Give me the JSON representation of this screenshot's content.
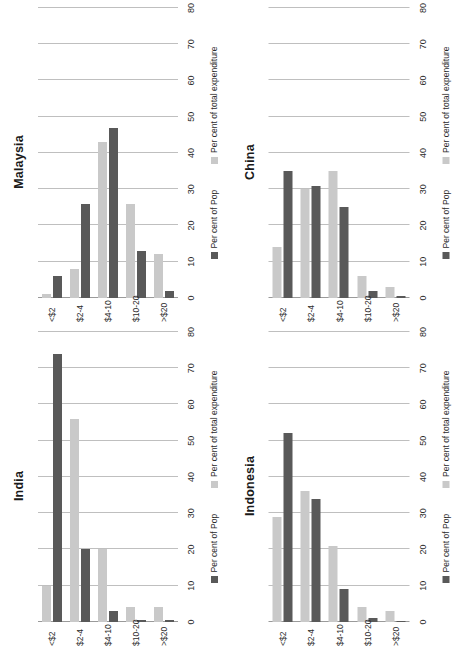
{
  "figure": {
    "layout": "2x2 grid of rotated horizontal bar charts",
    "panels_order": [
      "malaysia",
      "china",
      "india",
      "indonesia"
    ],
    "colors": {
      "pop_series": "#595959",
      "expenditure_series": "#c9c9c9",
      "gridline": "#bfbfbf",
      "background": "#ffffff"
    }
  },
  "legend": {
    "pop_label": "Per cent of Pop",
    "expenditure_label": "Per cent of total expenditure",
    "pop_swatch": "legend-swatch-pop",
    "expenditure_swatch": "legend-swatch-expenditure"
  },
  "axis": {
    "ticks": [
      "0",
      "10",
      "20",
      "30",
      "40",
      "50",
      "60",
      "70",
      "80"
    ],
    "categories": [
      "<$2",
      "$2-4",
      "$4-10",
      "$10-20",
      ">$20"
    ]
  },
  "chart_data": [
    {
      "type": "bar",
      "title": "Malaysia",
      "orientation": "horizontal",
      "categories": [
        "<$2",
        "$2-4",
        "$4-10",
        "$10-20",
        ">$20"
      ],
      "series": [
        {
          "name": "Per cent of Pop",
          "values": [
            6,
            26,
            47,
            13,
            2
          ]
        },
        {
          "name": "Per cent of total expenditure",
          "values": [
            1,
            8,
            43,
            26,
            12
          ]
        }
      ],
      "xlabel": "",
      "ylabel": "",
      "xlim": [
        0,
        80
      ],
      "ticks": [
        0,
        10,
        20,
        30,
        40,
        50,
        60,
        70,
        80
      ],
      "grid": true,
      "legend_position": "bottom"
    },
    {
      "type": "bar",
      "title": "China",
      "orientation": "horizontal",
      "categories": [
        "<$2",
        "$2-4",
        "$4-10",
        "$10-20",
        ">$20"
      ],
      "series": [
        {
          "name": "Per cent of Pop",
          "values": [
            35,
            31,
            25,
            2,
            0.5
          ]
        },
        {
          "name": "Per cent of total expenditure",
          "values": [
            14,
            30,
            35,
            6,
            3
          ]
        }
      ],
      "xlabel": "",
      "ylabel": "",
      "xlim": [
        0,
        80
      ],
      "ticks": [
        0,
        10,
        20,
        30,
        40,
        50,
        60,
        70,
        80
      ],
      "grid": true,
      "legend_position": "bottom"
    },
    {
      "type": "bar",
      "title": "India",
      "orientation": "horizontal",
      "categories": [
        "<$2",
        "$2-4",
        "$4-10",
        "$10-20",
        ">$20"
      ],
      "series": [
        {
          "name": "Per cent of Pop",
          "values": [
            74,
            20,
            3,
            0.5,
            0.5
          ]
        },
        {
          "name": "Per cent of total expenditure",
          "values": [
            10,
            56,
            20,
            4,
            4
          ]
        }
      ],
      "xlabel": "",
      "ylabel": "",
      "xlim": [
        0,
        80
      ],
      "ticks": [
        0,
        10,
        20,
        30,
        40,
        50,
        60,
        70,
        80
      ],
      "grid": true,
      "legend_position": "bottom"
    },
    {
      "type": "bar",
      "title": "Indonesia",
      "orientation": "horizontal",
      "categories": [
        "<$2",
        "$2-4",
        "$4-10",
        "$10-20",
        ">$20"
      ],
      "series": [
        {
          "name": "Per cent of Pop",
          "values": [
            52,
            34,
            9,
            1,
            0.4
          ]
        },
        {
          "name": "Per cent of total expenditure",
          "values": [
            29,
            36,
            21,
            4,
            3
          ]
        }
      ],
      "xlabel": "",
      "ylabel": "",
      "xlim": [
        0,
        80
      ],
      "ticks": [
        0,
        10,
        20,
        30,
        40,
        50,
        60,
        70,
        80
      ],
      "grid": true,
      "legend_position": "bottom"
    }
  ]
}
